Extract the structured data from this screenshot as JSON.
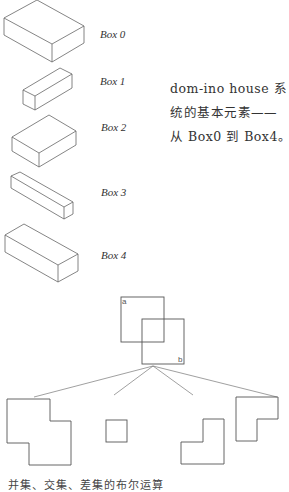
{
  "boxes": [
    {
      "label": "Box 0",
      "top": [
        [
          4,
          18
        ],
        [
          37,
          0
        ],
        [
          84,
          26
        ],
        [
          52,
          44
        ]
      ],
      "bottom": [
        [
          4,
          35
        ],
        [
          52,
          62
        ],
        [
          84,
          43
        ]
      ]
    },
    {
      "label": "Box 1",
      "top": [
        [
          23,
          90
        ],
        [
          60,
          68
        ],
        [
          72,
          74
        ],
        [
          35,
          96
        ]
      ],
      "bottom": [
        [
          23,
          104
        ],
        [
          35,
          110
        ],
        [
          72,
          88
        ]
      ]
    },
    {
      "label": "Box 2",
      "top": [
        [
          12,
          137
        ],
        [
          49,
          115
        ],
        [
          76,
          131
        ],
        [
          39,
          153
        ]
      ],
      "bottom": [
        [
          12,
          151
        ],
        [
          39,
          167
        ],
        [
          76,
          145
        ]
      ]
    },
    {
      "label": "Box 3",
      "top": [
        [
          11,
          176
        ],
        [
          20,
          172
        ],
        [
          73,
          202
        ],
        [
          64,
          207
        ]
      ],
      "bottom": [
        [
          11,
          188
        ],
        [
          64,
          219
        ],
        [
          73,
          214
        ]
      ]
    },
    {
      "label": "Box 4",
      "top": [
        [
          5,
          235
        ],
        [
          24,
          224
        ],
        [
          78,
          254
        ],
        [
          58,
          265
        ]
      ],
      "bottom": [
        [
          5,
          252
        ],
        [
          58,
          282
        ],
        [
          78,
          271
        ]
      ]
    }
  ],
  "caption": {
    "line1": "dom-ino house 系",
    "line2": "统的基本元素——",
    "line3": "从 Box0 到 Box4。"
  },
  "boolean_diagram": {
    "square_a_label": "a",
    "square_b_label": "b"
  },
  "bottom_caption": "并集、交集、差集的布尔运算",
  "colors": {
    "line": "#555555",
    "text": "#333333",
    "background": "#ffffff"
  }
}
